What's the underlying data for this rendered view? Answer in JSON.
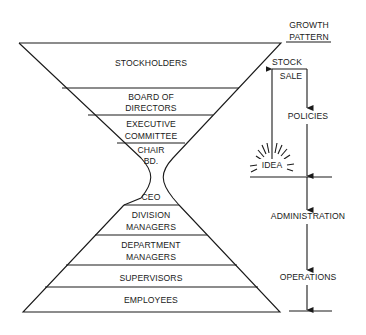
{
  "title": {
    "line1": "GROWTH",
    "line2": "PATTERN"
  },
  "upper_levels": [
    {
      "id": "stockholders",
      "lines": [
        "STOCKHOLDERS"
      ]
    },
    {
      "id": "board",
      "lines": [
        "BOARD OF",
        "DIRECTORS"
      ]
    },
    {
      "id": "exec",
      "lines": [
        "EXECUTIVE",
        "COMMITTEE"
      ]
    },
    {
      "id": "chair",
      "lines": [
        "CHAIR",
        "BD."
      ]
    }
  ],
  "lower_levels": [
    {
      "id": "ceo",
      "lines": [
        "CEO"
      ]
    },
    {
      "id": "division",
      "lines": [
        "DIVISION",
        "MANAGERS"
      ]
    },
    {
      "id": "department",
      "lines": [
        "DEPARTMENT",
        "MANAGERS"
      ]
    },
    {
      "id": "supervisors",
      "lines": [
        "SUPERVISORS"
      ]
    },
    {
      "id": "employees",
      "lines": [
        "EMPLOYEES"
      ]
    }
  ],
  "flow": {
    "stock_sale": [
      "STOCK",
      "SALE"
    ],
    "policies": "POLICIES",
    "idea": "IDEA",
    "administration": "ADMINISTRATION",
    "operations": "OPERATIONS"
  },
  "colors": {
    "ink": "#1a1a1a",
    "background": "#ffffff"
  }
}
